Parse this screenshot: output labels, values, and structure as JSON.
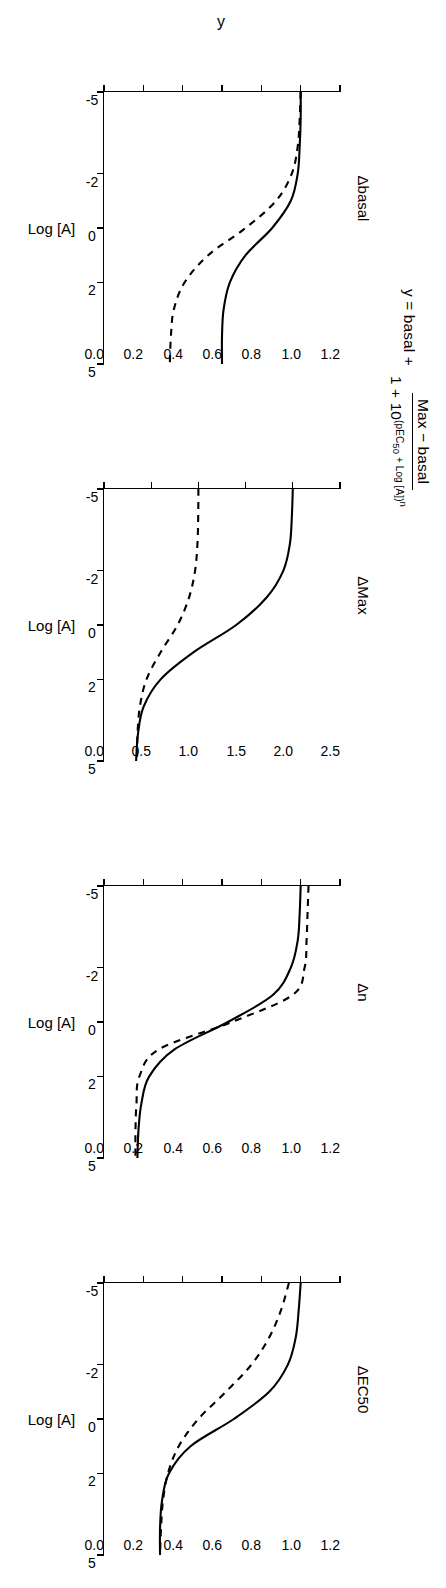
{
  "equation": {
    "lhs": "y = basal +",
    "numerator": "Max − basal",
    "denominator_prefix": "1 + 10",
    "denominator_exponent": "(pEC",
    "denominator_exponent_sub": "50",
    "denominator_exponent_rest": " + Log [A])",
    "denominator_power": "n"
  },
  "chart_data": {
    "type": "line",
    "xlabel": "Log [A]",
    "ylabel": "y",
    "xlim": [
      -5,
      5
    ],
    "xticks": [
      -5,
      -2,
      0,
      2,
      5
    ],
    "xticklabels": [
      "-5",
      "-2",
      "0",
      "2",
      "5"
    ],
    "grid": false,
    "legend": "none",
    "panels": [
      {
        "label": "Δbasal",
        "ylim": [
          0.0,
          1.2
        ],
        "yticks": [
          0.0,
          0.2,
          0.4,
          0.6,
          0.8,
          1.0,
          1.2
        ],
        "yticklabels": [
          "0.0",
          "0.2",
          "0.4",
          "0.6",
          "0.8",
          "1.0",
          "1.2"
        ],
        "show_y_axis_title": true,
        "series": [
          {
            "name": "reference",
            "style": "solid",
            "x": [
              -5,
              -4,
              -3,
              -2,
              -1,
              0,
              1,
              2,
              3,
              4,
              5
            ],
            "y": [
              1.0,
              1.0,
              0.995,
              0.985,
              0.95,
              0.855,
              0.72,
              0.64,
              0.608,
              0.6,
              0.6
            ]
          },
          {
            "name": "lowered basal",
            "style": "dashed",
            "x": [
              -5,
              -4,
              -3,
              -2,
              -1,
              0,
              1,
              2,
              3,
              4,
              5
            ],
            "y": [
              1.0,
              0.995,
              0.985,
              0.955,
              0.875,
              0.72,
              0.53,
              0.41,
              0.355,
              0.34,
              0.335
            ]
          }
        ]
      },
      {
        "label": "ΔMax",
        "ylim": [
          0.0,
          2.5
        ],
        "yticks": [
          0.0,
          0.5,
          1.0,
          1.5,
          2.0,
          2.5
        ],
        "yticklabels": [
          "0.0",
          "0.5",
          "1.0",
          "1.5",
          "2.0",
          "2.5"
        ],
        "show_y_axis_title": false,
        "series": [
          {
            "name": "higher Max",
            "style": "solid",
            "x": [
              -5,
              -4,
              -3,
              -2,
              -1,
              0,
              1,
              2,
              3,
              4,
              5
            ],
            "y": [
              2.0,
              1.99,
              1.97,
              1.9,
              1.72,
              1.4,
              0.95,
              0.6,
              0.42,
              0.36,
              0.34
            ]
          },
          {
            "name": "reference Max",
            "style": "dashed",
            "x": [
              -5,
              -4,
              -3,
              -2,
              -1,
              0,
              1,
              2,
              3,
              4,
              5
            ],
            "y": [
              1.0,
              0.998,
              0.99,
              0.965,
              0.9,
              0.78,
              0.6,
              0.45,
              0.38,
              0.355,
              0.35
            ]
          }
        ]
      },
      {
        "label": "Δn",
        "ylim": [
          0.0,
          1.2
        ],
        "yticks": [
          0.0,
          0.2,
          0.4,
          0.6,
          0.8,
          1.0,
          1.2
        ],
        "yticklabels": [
          "0.0",
          "0.2",
          "0.4",
          "0.6",
          "0.8",
          "1.0",
          "1.2"
        ],
        "show_y_axis_title": false,
        "series": [
          {
            "name": "n = 1",
            "style": "solid",
            "x": [
              -5,
              -4,
              -3,
              -2,
              -1,
              0,
              1,
              2,
              3,
              4,
              5
            ],
            "y": [
              1.0,
              0.995,
              0.985,
              0.95,
              0.86,
              0.63,
              0.36,
              0.23,
              0.19,
              0.175,
              0.17
            ]
          },
          {
            "name": "n = steeper",
            "style": "dashed",
            "x": [
              -5,
              -4,
              -3,
              -2,
              -1,
              0,
              1,
              2,
              3,
              4,
              5
            ],
            "y": [
              1.04,
              1.035,
              1.03,
              1.02,
              0.96,
              0.65,
              0.28,
              0.18,
              0.165,
              0.16,
              0.16
            ]
          }
        ]
      },
      {
        "label": "ΔEC50",
        "ylim": [
          0.0,
          1.2
        ],
        "yticks": [
          0.0,
          0.2,
          0.4,
          0.6,
          0.8,
          1.0,
          1.2
        ],
        "yticklabels": [
          "0.0",
          "0.2",
          "0.4",
          "0.6",
          "0.8",
          "1.0",
          "1.2"
        ],
        "show_y_axis_title": false,
        "series": [
          {
            "name": "reference EC50",
            "style": "solid",
            "x": [
              -5,
              -4,
              -3,
              -2,
              -1,
              0,
              1,
              2,
              3,
              4,
              5
            ],
            "y": [
              1.0,
              0.99,
              0.975,
              0.935,
              0.84,
              0.66,
              0.44,
              0.33,
              0.295,
              0.285,
              0.285
            ]
          },
          {
            "name": "shifted EC50",
            "style": "dashed",
            "x": [
              -5,
              -4,
              -3,
              -2,
              -1,
              0,
              1,
              2,
              3,
              4,
              5
            ],
            "y": [
              0.94,
              0.9,
              0.84,
              0.75,
              0.62,
              0.48,
              0.38,
              0.325,
              0.3,
              0.29,
              0.285
            ]
          }
        ]
      }
    ]
  }
}
